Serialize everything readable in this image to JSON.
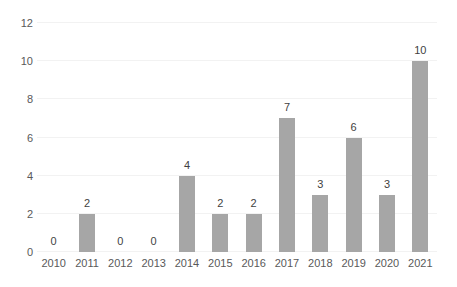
{
  "chart_data": {
    "type": "bar",
    "title": "",
    "subtitle": "",
    "xlabel": "",
    "ylabel": "",
    "categories": [
      "2010",
      "2011",
      "2012",
      "2013",
      "2014",
      "2015",
      "2016",
      "2017",
      "2018",
      "2019",
      "2020",
      "2021"
    ],
    "values": [
      0,
      2,
      0,
      0,
      4,
      2,
      2,
      7,
      3,
      6,
      3,
      10
    ],
    "data_labels": [
      "0",
      "2",
      "0",
      "0",
      "4",
      "2",
      "2",
      "7",
      "3",
      "6",
      "3",
      "10"
    ],
    "ylim": [
      0,
      12
    ],
    "ytick_values": [
      0,
      2,
      4,
      6,
      8,
      10,
      12
    ],
    "ytick_labels": [
      "0",
      "2",
      "4",
      "6",
      "8",
      "10",
      "12"
    ],
    "grid": "horizontal",
    "legend": "none",
    "annotations": [],
    "colors": {
      "bar": "#a6a6a6",
      "gridline": "#f2f2f2",
      "tick_label": "#595959",
      "data_label": "#3f3f3f",
      "background": "#ffffff"
    }
  }
}
